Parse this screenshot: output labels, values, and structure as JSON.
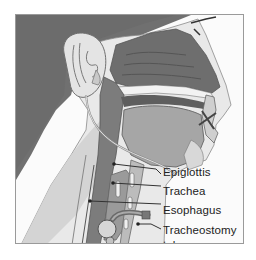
{
  "figure": {
    "colors": {
      "background_dark": "#707070",
      "skin": "#e9e9e9",
      "skin_shadow": "#d2d2d2",
      "tissue_dark": "#6e6e6e",
      "tissue_mid": "#9c9c9c",
      "tissue_light": "#bdbdbd",
      "frame": "#9a9a9a",
      "label_text": "#222222"
    },
    "labels": [
      {
        "id": "epiglottis",
        "text": "Epiglottis"
      },
      {
        "id": "trachea",
        "text": "Trachea"
      },
      {
        "id": "esophagus",
        "text": "Esophagus"
      },
      {
        "id": "tracheostomy-tube",
        "text": "Tracheostomy",
        "text2": "tube"
      }
    ]
  }
}
